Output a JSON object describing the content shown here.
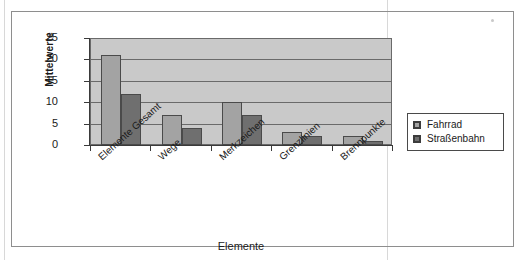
{
  "chart_data": {
    "type": "bar",
    "title": "",
    "xlabel": "Elemente",
    "ylabel": "Mittelwerte",
    "categories": [
      "Elemente Gesamt",
      "Wege",
      "Merkzeichen",
      "Grenzlinien",
      "Brennpunkte"
    ],
    "series": [
      {
        "name": "Fahrrad",
        "values": [
          21,
          7,
          10,
          3,
          2
        ],
        "color": "#a3a3a3"
      },
      {
        "name": "Straßenbahn",
        "values": [
          12,
          4,
          7,
          2,
          1
        ],
        "color": "#6f6f6f"
      }
    ],
    "ylim": [
      0,
      25
    ],
    "yticks": [
      0,
      5,
      10,
      15,
      20,
      25
    ],
    "ytick_labels": [
      "0",
      "5",
      "10",
      "15",
      "20",
      "25"
    ],
    "grid": true,
    "grid_axis": "y",
    "legend_position": "right",
    "plot_background": "#c9c9c9",
    "axis_color": "#3a3a3a"
  },
  "legend": {
    "entries": [
      {
        "label": "Fahrrad"
      },
      {
        "label": "Straßenbahn"
      }
    ]
  },
  "icons": {
    "legend_swatch": "square-swatch-icon"
  }
}
